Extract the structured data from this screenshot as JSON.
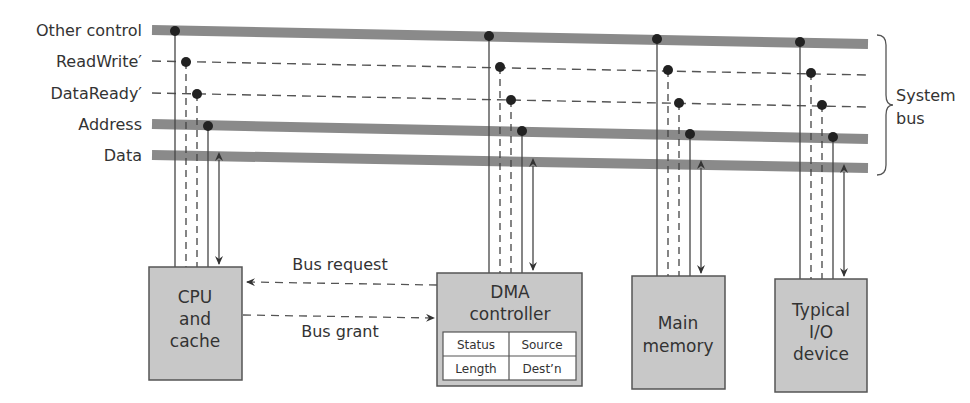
{
  "bus_labels": {
    "other_control": "Other control",
    "readwrite": "ReadWrite′",
    "dataready": "DataReady′",
    "address": "Address",
    "data": "Data"
  },
  "system_bus": {
    "line1": "System",
    "line2": "bus"
  },
  "cpu": {
    "line1": "CPU",
    "line2": "and",
    "line3": "cache"
  },
  "dma": {
    "line1": "DMA",
    "line2": "controller",
    "registers": {
      "status": "Status",
      "source": "Source",
      "length": "Length",
      "destn": "Dest’n"
    }
  },
  "memory": {
    "line1": "Main",
    "line2": "memory"
  },
  "io": {
    "line1": "Typical",
    "line2": "I/O",
    "line3": "device"
  },
  "arrows": {
    "bus_request": "Bus request",
    "bus_grant": "Bus grant"
  },
  "colors": {
    "bus": "#8a8a8a",
    "box_fill": "#c8c8c8",
    "line": "#444444"
  }
}
